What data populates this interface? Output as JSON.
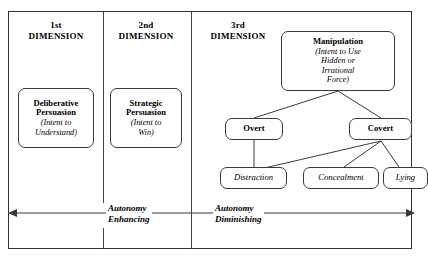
{
  "figure": {
    "frame_color": "#333333",
    "line_color": "#3a3a3a"
  },
  "columns": [
    {
      "ordinal": "1st",
      "dimension": "DIMENSION"
    },
    {
      "ordinal": "2nd",
      "dimension": "DIMENSION"
    },
    {
      "ordinal": "3rd",
      "dimension": "DIMENSION"
    }
  ],
  "nodes": {
    "deliberative": {
      "bold_line_1": "Deliberative",
      "bold_line_2": "Persuasion",
      "italic_line_1": "(Intent to",
      "italic_line_2": "Understand)"
    },
    "strategic": {
      "bold_line_1": "Strategic",
      "bold_line_2": "Persuasion",
      "italic_line_1": "(Intent to",
      "italic_line_2": "Win)"
    },
    "manipulation": {
      "bold_line_1": "Manipulation",
      "italic_line_1": "(Intent to Use",
      "italic_line_2": "Hidden or",
      "italic_line_3": "Irrational",
      "italic_line_4": "Force)"
    },
    "overt": {
      "bold_line_1": "Overt"
    },
    "covert": {
      "bold_line_1": "Covert"
    },
    "distraction": {
      "italic_line_1": "Distraction"
    },
    "concealment": {
      "italic_line_1": "Concealment"
    },
    "lying": {
      "italic_line_1": "Lying"
    }
  },
  "axis": {
    "left_label_line_1": "Autonomy",
    "left_label_line_2": "Enhancing",
    "right_label_line_1": "Autonomy",
    "right_label_line_2": "Diminishing",
    "arrow_style": "double-headed"
  }
}
